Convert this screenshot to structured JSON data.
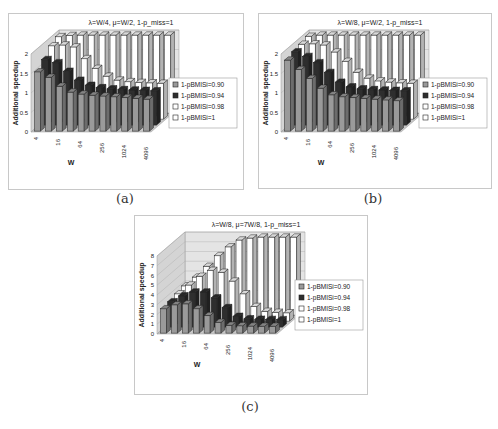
{
  "figure": {
    "captions": [
      "(a)",
      "(b)",
      "(c)"
    ]
  },
  "chart_data": [
    {
      "id": "a",
      "type": "bar",
      "variant": "3d-clustered-depth",
      "title": "λ=W/4, μ=W/2, 1-p_miss=1",
      "xlabel": "W",
      "ylabel": "Additional speedup",
      "ylim": [
        0,
        2
      ],
      "yticks": [
        "0",
        "0.5",
        "1",
        "1.5",
        "2"
      ],
      "categories": [
        "4",
        "8",
        "16",
        "32",
        "64",
        "128",
        "256",
        "512",
        "1024",
        "2048",
        "4096"
      ],
      "tick_labels_shown": [
        "4",
        "16",
        "64",
        "256",
        "1024",
        "4096"
      ],
      "series": [
        {
          "name": "1-pBMISi=0.90",
          "color": "#9a9a9a",
          "values": [
            1.52,
            1.38,
            1.15,
            1.0,
            0.95,
            0.92,
            0.9,
            0.88,
            0.86,
            0.84,
            0.82
          ]
        },
        {
          "name": "1-pBMISi=0.94",
          "color": "#2e2e2e",
          "values": [
            1.68,
            1.6,
            1.38,
            1.15,
            1.02,
            0.96,
            0.93,
            0.91,
            0.9,
            0.89,
            0.88
          ]
        },
        {
          "name": "1-pBMISi=0.98",
          "color": "#ffffff",
          "values": [
            1.88,
            1.9,
            1.85,
            1.55,
            1.3,
            1.1,
            1.0,
            0.96,
            0.94,
            0.93,
            0.92
          ]
        },
        {
          "name": "1-pBMISi=1",
          "color": "#ffffff",
          "values": [
            1.96,
            1.99,
            2.0,
            2.0,
            2.0,
            2.0,
            2.0,
            2.0,
            2.0,
            2.0,
            2.0
          ]
        }
      ],
      "legend_position": "right",
      "grid": true
    },
    {
      "id": "b",
      "type": "bar",
      "variant": "3d-clustered-depth",
      "title": "λ=W/8, μ=W/2, 1-p_miss=1",
      "xlabel": "W",
      "ylabel": "Additional speedup",
      "ylim": [
        0,
        2
      ],
      "yticks": [
        "0",
        "0.5",
        "1",
        "1.5",
        "2"
      ],
      "categories": [
        "4",
        "8",
        "16",
        "32",
        "64",
        "128",
        "256",
        "512",
        "1024",
        "2048",
        "4096"
      ],
      "tick_labels_shown": [
        "4",
        "16",
        "64",
        "256",
        "1024",
        "4096"
      ],
      "series": [
        {
          "name": "1-pBMISi=0.90",
          "color": "#9a9a9a",
          "values": [
            1.82,
            1.58,
            1.35,
            1.1,
            0.93,
            0.88,
            0.86,
            0.84,
            0.82,
            0.8,
            0.78
          ]
        },
        {
          "name": "1-pBMISi=0.94",
          "color": "#2e2e2e",
          "values": [
            1.88,
            1.76,
            1.6,
            1.35,
            1.1,
            0.98,
            0.93,
            0.91,
            0.9,
            0.89,
            0.88
          ]
        },
        {
          "name": "1-pBMISi=0.98",
          "color": "#ffffff",
          "values": [
            1.92,
            1.93,
            1.9,
            1.72,
            1.48,
            1.2,
            1.05,
            0.98,
            0.95,
            0.93,
            0.92
          ]
        },
        {
          "name": "1-pBMISi=1",
          "color": "#ffffff",
          "values": [
            1.97,
            2.0,
            2.0,
            2.0,
            2.0,
            2.0,
            2.0,
            2.0,
            2.0,
            2.0,
            2.0
          ]
        }
      ],
      "legend_position": "right",
      "grid": true
    },
    {
      "id": "c",
      "type": "bar",
      "variant": "3d-clustered-depth",
      "title": "λ=W/8, μ=7W/8, 1-p_miss=1",
      "xlabel": "W",
      "ylabel": "Additional speedup",
      "ylim": [
        0,
        8
      ],
      "yticks": [
        "0",
        "1",
        "2",
        "3",
        "4",
        "5",
        "6",
        "7",
        "8"
      ],
      "categories": [
        "4",
        "8",
        "16",
        "32",
        "64",
        "128",
        "256",
        "512",
        "1024",
        "2048",
        "4096"
      ],
      "tick_labels_shown": [
        "4",
        "16",
        "64",
        "256",
        "1024",
        "4096"
      ],
      "series": [
        {
          "name": "1-pBMISi=0.90",
          "color": "#9a9a9a",
          "values": [
            2.5,
            2.9,
            3.0,
            2.5,
            1.8,
            1.1,
            0.8,
            0.75,
            0.72,
            0.7,
            0.7
          ]
        },
        {
          "name": "1-pBMISi=0.94",
          "color": "#2e2e2e",
          "values": [
            2.6,
            3.2,
            3.6,
            3.6,
            3.0,
            2.0,
            1.1,
            0.85,
            0.8,
            0.78,
            0.76
          ]
        },
        {
          "name": "1-pBMISi=0.98",
          "color": "#ffffff",
          "values": [
            2.8,
            3.7,
            4.6,
            5.2,
            5.0,
            4.1,
            2.8,
            1.5,
            1.0,
            0.9,
            0.85
          ]
        },
        {
          "name": "1-pBMISi=1",
          "color": "#ffffff",
          "values": [
            3.0,
            3.9,
            5.0,
            6.1,
            7.0,
            7.7,
            7.9,
            8.0,
            8.0,
            8.0,
            8.0
          ]
        }
      ],
      "legend_position": "right",
      "grid": true
    }
  ]
}
